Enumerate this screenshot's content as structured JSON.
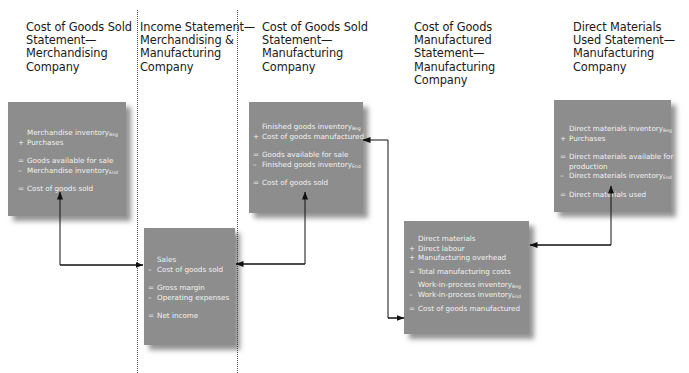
{
  "columns": [
    {
      "heading": [
        "Cost of Goods Sold",
        "Statement—",
        "Merchandising",
        "Company"
      ],
      "box": {
        "lines": [
          {
            "op": "",
            "text": "Merchandise inventory",
            "sub": "Beg"
          },
          {
            "op": "+",
            "text": "Purchases",
            "sub": ""
          },
          {
            "gap": true
          },
          {
            "op": "=",
            "text": "Goods available for sale",
            "sub": ""
          },
          {
            "op": "–",
            "text": "Merchandise inventory",
            "sub": "End"
          },
          {
            "gap": true
          },
          {
            "op": "=",
            "text": "Cost of goods sold",
            "sub": ""
          }
        ]
      }
    },
    {
      "heading": [
        "Income Statement—",
        "Merchandising &",
        "Manufacturing",
        "Company"
      ],
      "box": {
        "lines": [
          {
            "op": "",
            "text": "Sales",
            "sub": ""
          },
          {
            "op": "–",
            "text": "Cost of goods sold",
            "sub": ""
          },
          {
            "gap": true
          },
          {
            "op": "=",
            "text": "Gross margin",
            "sub": ""
          },
          {
            "op": "–",
            "text": "Operating expenses",
            "sub": ""
          },
          {
            "gap": true
          },
          {
            "op": "=",
            "text": "Net income",
            "sub": ""
          }
        ]
      }
    },
    {
      "heading": [
        "Cost of Goods Sold",
        "Statement—",
        "Manufacturing",
        "Company"
      ],
      "box": {
        "lines": [
          {
            "op": "",
            "text": "Finished goods inventory",
            "sub": "Beg"
          },
          {
            "op": "+",
            "text": "Cost of goods manufactured",
            "sub": ""
          },
          {
            "gap": true
          },
          {
            "op": "=",
            "text": "Goods available for sale",
            "sub": ""
          },
          {
            "op": "–",
            "text": "Finished goods inventory",
            "sub": "End"
          },
          {
            "gap": true
          },
          {
            "op": "=",
            "text": "Cost of goods sold",
            "sub": ""
          }
        ]
      }
    },
    {
      "heading": [
        "Cost of Goods",
        "Manufactured",
        "Statement—",
        "Manufacturing",
        "Company"
      ],
      "box": {
        "lines": [
          {
            "op": "",
            "text": "Direct materials",
            "sub": ""
          },
          {
            "op": "+",
            "text": "Direct labour",
            "sub": ""
          },
          {
            "op": "+",
            "text": "Manufacturing overhead",
            "sub": ""
          },
          {
            "smallgap": true
          },
          {
            "op": "=",
            "text": "Total manufacturing costs",
            "sub": ""
          },
          {
            "smallgap": true
          },
          {
            "op": "",
            "text": "Work-in-process inventory",
            "sub": "Beg"
          },
          {
            "op": "–",
            "text": "Work-in-process inventory",
            "sub": "End"
          },
          {
            "smallgap": true
          },
          {
            "op": "=",
            "text": "Cost of goods manufactured",
            "sub": ""
          }
        ]
      }
    },
    {
      "heading": [
        "Direct Materials",
        "Used Statement—",
        "Manufacturing",
        "Company"
      ],
      "box": {
        "lines": [
          {
            "op": "",
            "text": "Direct materials inventory",
            "sub": "Beg"
          },
          {
            "op": "+",
            "text": "Purchases",
            "sub": ""
          },
          {
            "gap": true
          },
          {
            "op": "=",
            "text": "Direct materials available for",
            "sub": ""
          },
          {
            "op": "",
            "text": "production",
            "sub": ""
          },
          {
            "op": "–",
            "text": "Direct materials inventory",
            "sub": "End"
          },
          {
            "gap": true
          },
          {
            "op": "=",
            "text": "Direct materials used",
            "sub": ""
          }
        ]
      }
    }
  ],
  "colors": {
    "box_fill": "#8d8d8d",
    "box_text": "#f2f2f2",
    "heading_text": "#1a1a1a",
    "connector": "#111111"
  }
}
